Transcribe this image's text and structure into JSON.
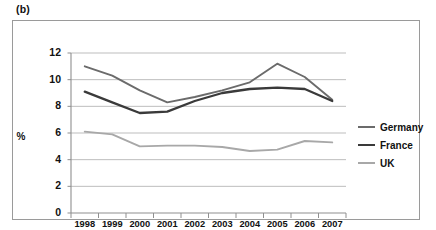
{
  "panel": {
    "label": "(b)"
  },
  "chart_data": {
    "type": "line",
    "title": "",
    "subtitle": "",
    "xlabel": "",
    "ylabel": "%",
    "x": [
      1998,
      1999,
      2000,
      2001,
      2002,
      2003,
      2004,
      2005,
      2006,
      2007
    ],
    "categories": [
      "1998",
      "1999",
      "2000",
      "2001",
      "2002",
      "2003",
      "2004",
      "2005",
      "2006",
      "2007"
    ],
    "series": [
      {
        "name": "Germany",
        "color": "#6b6b6b",
        "values": [
          11.0,
          10.3,
          9.2,
          8.3,
          8.7,
          9.2,
          9.8,
          11.2,
          10.2,
          8.5
        ]
      },
      {
        "name": "France",
        "color": "#3a3a3a",
        "values": [
          9.1,
          8.3,
          7.5,
          7.6,
          8.4,
          9.0,
          9.3,
          9.4,
          9.3,
          8.4
        ]
      },
      {
        "name": "UK",
        "color": "#a8a8a8",
        "values": [
          6.1,
          5.9,
          5.0,
          5.05,
          5.05,
          4.95,
          4.65,
          4.75,
          5.4,
          5.3
        ]
      }
    ],
    "ylim": [
      0,
      12
    ],
    "yticks": [
      0,
      2,
      4,
      6,
      8,
      10,
      12
    ],
    "ytick_labels": [
      "0",
      "2",
      "4",
      "6",
      "8",
      "10",
      "12"
    ],
    "grid": true,
    "grid_axis": "y",
    "legend_position": "right"
  },
  "legend": {
    "entries": [
      {
        "label": "Germany"
      },
      {
        "label": "France"
      },
      {
        "label": "UK"
      }
    ]
  },
  "colors": {
    "germany": "#6b6b6b",
    "france": "#3a3a3a",
    "uk": "#a8a8a8",
    "grid": "#b5b5b5",
    "axis": "#8f8f8f",
    "frame": "#9a9a9a",
    "text": "#111111"
  }
}
